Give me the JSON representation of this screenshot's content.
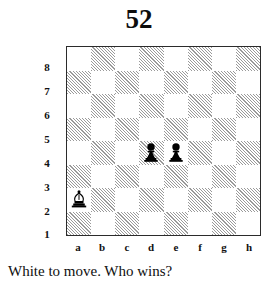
{
  "puzzle": {
    "number": "52",
    "caption": "White to move. Who wins?",
    "side_to_move": "White"
  },
  "board": {
    "files": [
      "a",
      "b",
      "c",
      "d",
      "e",
      "f",
      "g",
      "h"
    ],
    "ranks": [
      "8",
      "7",
      "6",
      "5",
      "4",
      "3",
      "2",
      "1"
    ],
    "orientation": "white-bottom",
    "light_square_color": "#ffffff",
    "dark_square_color": "#9a9a9a",
    "border_color": "#2b2b2b",
    "dark_square_style": "diagonal-hatch",
    "pieces": [
      {
        "id": "white-bishop-a2",
        "color": "white",
        "type": "bishop",
        "square": "a2",
        "file": "a",
        "rank": "2",
        "glyph": "bishop-white-icon"
      },
      {
        "id": "black-pawn-d4",
        "color": "black",
        "type": "pawn",
        "square": "d4",
        "file": "d",
        "rank": "4",
        "glyph": "pawn-black-icon"
      },
      {
        "id": "black-pawn-e4",
        "color": "black",
        "type": "pawn",
        "square": "e4",
        "file": "e",
        "rank": "4",
        "glyph": "pawn-black-icon"
      }
    ]
  }
}
